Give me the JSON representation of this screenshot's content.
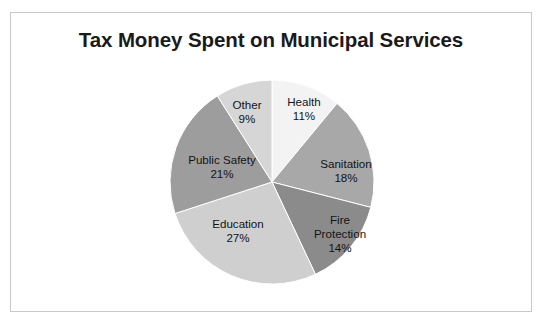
{
  "chart_data": {
    "type": "pie",
    "title": "Tax Money Spent on Municipal Services",
    "xlabel": "",
    "ylabel": "",
    "legend": "none",
    "grid": false,
    "units": "percent",
    "start_angle_deg": 0,
    "direction": "clockwise",
    "categories": [
      "Health",
      "Sanitation",
      "Fire Protection",
      "Education",
      "Public Safety",
      "Other"
    ],
    "values": [
      11,
      18,
      14,
      27,
      21,
      9
    ],
    "slices": [
      {
        "label": "Health",
        "value": 11,
        "value_label": "11%",
        "color": "#f3f3f3",
        "start_deg": 0.0,
        "end_deg": 39.6
      },
      {
        "label": "Sanitation",
        "value": 18,
        "value_label": "18%",
        "color": "#a8a8a8",
        "start_deg": 39.6,
        "end_deg": 104.4
      },
      {
        "label": "Fire Protection",
        "value": 14,
        "value_label": "14%",
        "color": "#8b8b8b",
        "start_deg": 104.4,
        "end_deg": 154.8
      },
      {
        "label": "Education",
        "value": 27,
        "value_label": "27%",
        "color": "#cfcfcf",
        "start_deg": 154.8,
        "end_deg": 252.0
      },
      {
        "label": "Public Safety",
        "value": 21,
        "value_label": "21%",
        "color": "#9d9d9d",
        "start_deg": 252.0,
        "end_deg": 327.6
      },
      {
        "label": "Other",
        "value": 9,
        "value_label": "9%",
        "color": "#d6d6d6",
        "start_deg": 327.6,
        "end_deg": 360.0
      }
    ]
  },
  "labels": {
    "health_name": "Health",
    "health_pct": "11%",
    "sanitation_name": "Sanitation",
    "sanitation_pct": "18%",
    "fire_name_line1": "Fire",
    "fire_name_line2": "Protection",
    "fire_pct": "14%",
    "education_name": "Education",
    "education_pct": "27%",
    "public_safety_name": "Public Safety",
    "public_safety_pct": "21%",
    "other_name": "Other",
    "other_pct": "9%"
  },
  "colors": {
    "background": "#ffffff",
    "frame_border": "#c9c9c9",
    "title_text": "#1a1a1a",
    "label_text": "#141414"
  }
}
